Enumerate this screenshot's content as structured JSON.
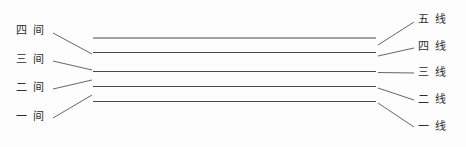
{
  "diagram": {
    "background_color": "#fdfdfd",
    "staff": {
      "line_color": "#4a4a4a",
      "line_width": 1,
      "x_start": 93,
      "x_end": 376,
      "lines": [
        {
          "name": "五线",
          "y": 38
        },
        {
          "name": "四线",
          "y": 52.5
        },
        {
          "name": "三线",
          "y": 71.5
        },
        {
          "name": "二线",
          "y": 86.5
        },
        {
          "name": "一线",
          "y": 101.5
        }
      ]
    },
    "leader_color": "#555555"
  },
  "left_labels": [
    {
      "text": "四 间",
      "x": 16,
      "y": 31,
      "leader": {
        "x1": 53,
        "y1": 33,
        "x2": 92,
        "y2": 54
      }
    },
    {
      "text": "三 间",
      "x": 16,
      "y": 60,
      "leader": {
        "x1": 53,
        "y1": 61,
        "x2": 92,
        "y2": 70
      }
    },
    {
      "text": "二 间",
      "x": 16,
      "y": 88,
      "leader": {
        "x1": 53,
        "y1": 89,
        "x2": 92,
        "y2": 80
      }
    },
    {
      "text": "一 间",
      "x": 16,
      "y": 117,
      "leader": {
        "x1": 53,
        "y1": 118,
        "x2": 92,
        "y2": 95
      }
    }
  ],
  "right_labels": [
    {
      "text": "五 线",
      "x": 418,
      "y": 20,
      "leader": {
        "x1": 378,
        "y1": 45,
        "x2": 414,
        "y2": 22
      }
    },
    {
      "text": "四 线",
      "x": 418,
      "y": 47,
      "leader": {
        "x1": 378,
        "y1": 56,
        "x2": 414,
        "y2": 48
      }
    },
    {
      "text": "三 线",
      "x": 418,
      "y": 73,
      "leader": {
        "x1": 378,
        "y1": 72.5,
        "x2": 414,
        "y2": 73
      }
    },
    {
      "text": "二 线",
      "x": 418,
      "y": 100,
      "leader": {
        "x1": 378,
        "y1": 88,
        "x2": 414,
        "y2": 100
      }
    },
    {
      "text": "一 线",
      "x": 418,
      "y": 127,
      "leader": {
        "x1": 378,
        "y1": 103,
        "x2": 414,
        "y2": 127
      }
    }
  ]
}
